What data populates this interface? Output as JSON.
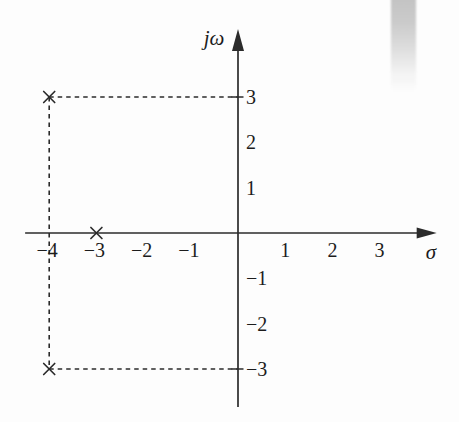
{
  "page": {
    "background_color": "#fdfdfd",
    "scan_artifact": {
      "description": "gray-gradient-bar",
      "color_top": "#c3c3c3"
    }
  },
  "chart_data": {
    "type": "scatter",
    "xlabel": "σ",
    "ylabel": "jω",
    "xlim": [
      -4.51,
      4.21
    ],
    "ylim": [
      -3.84,
      4.5
    ],
    "grid": false,
    "legend": null,
    "line_color": "#2b2b2b",
    "text_color": "#1c1c1c",
    "x_ticks": [
      {
        "value": -4,
        "label": "−4"
      },
      {
        "value": -3,
        "label": "−3"
      },
      {
        "value": -2,
        "label": "−2"
      },
      {
        "value": -1,
        "label": "−1"
      },
      {
        "value": 1,
        "label": "1"
      },
      {
        "value": 2,
        "label": "2"
      },
      {
        "value": 3,
        "label": "3"
      }
    ],
    "y_ticks": [
      {
        "value": 3,
        "label": "3"
      },
      {
        "value": 2,
        "label": "2"
      },
      {
        "value": 1,
        "label": "1"
      },
      {
        "value": -1,
        "label": "−1"
      },
      {
        "value": -2,
        "label": "−2"
      },
      {
        "value": -3,
        "label": "−3"
      }
    ],
    "y_axis_tick_marks": [
      3,
      -3
    ],
    "points": [
      {
        "x": -4,
        "y": 3,
        "marker": "x"
      },
      {
        "x": -4,
        "y": -3,
        "marker": "x"
      },
      {
        "x": -3,
        "y": 0,
        "marker": "x"
      }
    ],
    "guide_lines": [
      {
        "from": {
          "x": -4,
          "y": 3
        },
        "to": {
          "x": 0,
          "y": 3
        },
        "style": "dashed"
      },
      {
        "from": {
          "x": -4,
          "y": -3
        },
        "to": {
          "x": 0,
          "y": -3
        },
        "style": "dashed"
      },
      {
        "from": {
          "x": -4,
          "y": 3
        },
        "to": {
          "x": -4,
          "y": -3
        },
        "style": "dashed"
      }
    ]
  }
}
